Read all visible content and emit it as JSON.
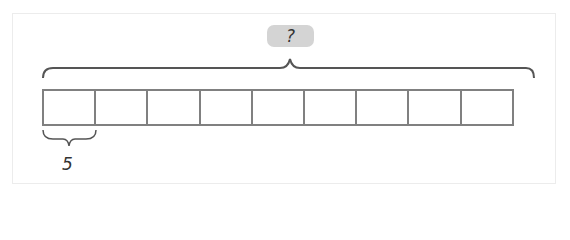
{
  "diagram": {
    "type": "tape-diagram",
    "total_label": "?",
    "unit_label": "5",
    "box_count": 9,
    "boxes": [
      "",
      "",
      "",
      "",
      "",
      "",
      "",
      "",
      ""
    ],
    "colors": {
      "box_border": "#808080",
      "brace": "#555555",
      "pill": "#d4d4d4"
    }
  }
}
